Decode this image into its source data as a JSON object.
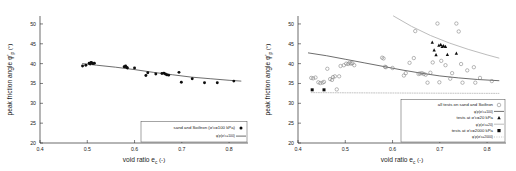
{
  "figure": {
    "panels": [
      "left",
      "right"
    ],
    "colors": {
      "marker_filled": "#0d0d0d",
      "marker_open_stroke": "#7d7d7d",
      "curve_100": "#3c3c3c",
      "curve_20": "#b8b8b8",
      "curve_2000": "#9a9a9a",
      "axis": "#2b2b2b"
    }
  },
  "chart_data": [
    {
      "id": "left",
      "type": "scatter",
      "title": "",
      "xlabel": "void ratio e",
      "xlabel_sub": "c",
      "xlabel_unit": "(-)",
      "ylabel": "peak friction angle φ'",
      "ylabel_sub": "p",
      "ylabel_unit": "(°)",
      "xlim": [
        0.4,
        0.84
      ],
      "ylim": [
        20,
        52
      ],
      "xticks": [
        0.4,
        0.5,
        0.6,
        0.7,
        0.8
      ],
      "xticklabels": [
        "0.4",
        "0.5",
        "0.6",
        "0.7",
        "0.8"
      ],
      "yticks": [
        20,
        25,
        30,
        35,
        40,
        45,
        50
      ],
      "yticklabels": [
        "20",
        "25",
        "30",
        "35",
        "40",
        "45",
        "50"
      ],
      "grid": false,
      "legend_position": "lower right",
      "series": [
        {
          "name": "sand and Soiltron (σ'c=100 kPa)",
          "marker": "filled-circle",
          "points": [
            [
              0.49,
              39.4
            ],
            [
              0.497,
              39.6
            ],
            [
              0.504,
              40.1
            ],
            [
              0.506,
              39.9
            ],
            [
              0.508,
              40.3
            ],
            [
              0.51,
              40.2
            ],
            [
              0.512,
              40.0
            ],
            [
              0.515,
              40.1
            ],
            [
              0.578,
              39.2
            ],
            [
              0.581,
              39.4
            ],
            [
              0.583,
              39.1
            ],
            [
              0.585,
              38.9
            ],
            [
              0.6,
              38.9
            ],
            [
              0.624,
              37.0
            ],
            [
              0.628,
              37.7
            ],
            [
              0.645,
              37.4
            ],
            [
              0.658,
              37.5
            ],
            [
              0.662,
              37.6
            ],
            [
              0.665,
              37.4
            ],
            [
              0.668,
              37.2
            ],
            [
              0.672,
              37.1
            ],
            [
              0.694,
              37.8
            ],
            [
              0.699,
              35.3
            ],
            [
              0.722,
              36.2
            ],
            [
              0.748,
              35.2
            ],
            [
              0.775,
              35.2
            ],
            [
              0.81,
              35.6
            ]
          ]
        }
      ],
      "curves": [
        {
          "name": "φ'p(σ'c=100)",
          "style": "solid",
          "color": "#3c3c3c",
          "x": [
            0.49,
            0.52,
            0.56,
            0.6,
            0.64,
            0.68,
            0.72,
            0.76,
            0.8,
            0.825
          ],
          "y": [
            40.0,
            39.6,
            39.1,
            38.5,
            37.8,
            37.2,
            36.6,
            36.2,
            35.8,
            35.6
          ]
        }
      ],
      "legend": [
        {
          "label": "sand and Soiltron (σ'",
          "sub": "c",
          "tail": "=100 kPa)",
          "symbol": "filled-circle"
        },
        {
          "label": "φ'",
          "sub": "p",
          "tail": "(σ'c=100)",
          "symbol": "line-solid-dark"
        }
      ]
    },
    {
      "id": "right",
      "type": "scatter",
      "title": "",
      "xlabel": "void ratio e",
      "xlabel_sub": "c",
      "xlabel_unit": "(-)",
      "ylabel": "peak friction angle φ'",
      "ylabel_sub": "p",
      "ylabel_unit": "(°)",
      "xlim": [
        0.4,
        0.84
      ],
      "ylim": [
        20,
        52
      ],
      "xticks": [
        0.4,
        0.5,
        0.6,
        0.7,
        0.8
      ],
      "xticklabels": [
        "0.4",
        "0.5",
        "0.6",
        "0.7",
        "0.8"
      ],
      "yticks": [
        20,
        25,
        30,
        35,
        40,
        45,
        50
      ],
      "yticklabels": [
        "20",
        "25",
        "30",
        "35",
        "40",
        "45",
        "50"
      ],
      "grid": false,
      "legend_position": "lower right",
      "series": [
        {
          "name": "all tests on sand and Soiltron",
          "marker": "open-circle",
          "points": [
            [
              0.428,
              36.4
            ],
            [
              0.432,
              36.3
            ],
            [
              0.437,
              36.5
            ],
            [
              0.443,
              35.3
            ],
            [
              0.447,
              35.1
            ],
            [
              0.452,
              35.2
            ],
            [
              0.455,
              35.4
            ],
            [
              0.462,
              38.7
            ],
            [
              0.468,
              36.1
            ],
            [
              0.472,
              35.9
            ],
            [
              0.474,
              36.6
            ],
            [
              0.478,
              36.8
            ],
            [
              0.482,
              33.5
            ],
            [
              0.487,
              36.8
            ],
            [
              0.49,
              39.4
            ],
            [
              0.497,
              39.6
            ],
            [
              0.502,
              40.0
            ],
            [
              0.506,
              39.9
            ],
            [
              0.509,
              40.2
            ],
            [
              0.512,
              40.0
            ],
            [
              0.515,
              40.1
            ],
            [
              0.519,
              39.6
            ],
            [
              0.578,
              41.5
            ],
            [
              0.581,
              41.3
            ],
            [
              0.584,
              39.2
            ],
            [
              0.586,
              39.1
            ],
            [
              0.6,
              38.9
            ],
            [
              0.624,
              37.0
            ],
            [
              0.628,
              37.6
            ],
            [
              0.636,
              40.2
            ],
            [
              0.645,
              41.4
            ],
            [
              0.648,
              48.2
            ],
            [
              0.655,
              37.4
            ],
            [
              0.658,
              37.5
            ],
            [
              0.662,
              37.6
            ],
            [
              0.666,
              37.4
            ],
            [
              0.67,
              37.2
            ],
            [
              0.674,
              35.2
            ],
            [
              0.68,
              37.7
            ],
            [
              0.685,
              40.3
            ],
            [
              0.695,
              50.1
            ],
            [
              0.699,
              35.3
            ],
            [
              0.703,
              40.7
            ],
            [
              0.712,
              39.6
            ],
            [
              0.722,
              36.2
            ],
            [
              0.726,
              37.6
            ],
            [
              0.735,
              50.1
            ],
            [
              0.74,
              48.1
            ],
            [
              0.745,
              39.9
            ],
            [
              0.748,
              35.2
            ],
            [
              0.758,
              38.3
            ],
            [
              0.772,
              39.1
            ],
            [
              0.775,
              35.2
            ],
            [
              0.785,
              36.4
            ],
            [
              0.81,
              35.6
            ]
          ]
        },
        {
          "name": "tests at σ'c=20 kPa",
          "marker": "filled-triangle",
          "points": [
            [
              0.684,
              45.4
            ],
            [
              0.688,
              43.4
            ],
            [
              0.692,
              42.2
            ],
            [
              0.698,
              44.6
            ],
            [
              0.702,
              44.8
            ],
            [
              0.705,
              44.3
            ],
            [
              0.708,
              44.5
            ],
            [
              0.712,
              44.3
            ],
            [
              0.716,
              42.3
            ],
            [
              0.735,
              42.6
            ]
          ]
        },
        {
          "name": "tests at σ'c=2000 kPa",
          "marker": "filled-square",
          "points": [
            [
              0.43,
              33.4
            ],
            [
              0.455,
              33.4
            ]
          ]
        }
      ],
      "curves": [
        {
          "name": "φ'p(σ'c=100)",
          "style": "solid",
          "color": "#3c3c3c",
          "x": [
            0.422,
            0.46,
            0.5,
            0.54,
            0.58,
            0.62,
            0.66,
            0.7,
            0.74,
            0.78,
            0.825
          ],
          "y": [
            42.7,
            42.0,
            41.1,
            40.2,
            39.3,
            38.4,
            37.6,
            36.9,
            36.4,
            36.0,
            35.7
          ]
        },
        {
          "name": "φ'p(σ'c=20)",
          "style": "solid-light",
          "color": "#b8b8b8",
          "x": [
            0.602,
            0.64,
            0.68,
            0.72,
            0.76,
            0.8,
            0.825
          ],
          "y": [
            52.0,
            49.4,
            47.1,
            45.2,
            43.6,
            42.2,
            41.4
          ]
        },
        {
          "name": "φ'p(σ'c=2000)",
          "style": "dotted",
          "color": "#9a9a9a",
          "x": [
            0.428,
            0.5,
            0.6,
            0.7,
            0.825
          ],
          "y": [
            32.7,
            32.65,
            32.6,
            32.55,
            32.5
          ]
        }
      ],
      "legend": [
        {
          "label": "all tests on sand and Soiltron",
          "symbol": "open-circle"
        },
        {
          "label": "φ'p(σ'c=100)",
          "symbol": "line-solid-dark"
        },
        {
          "label": "tests at σ'c=20 kPa",
          "symbol": "filled-triangle"
        },
        {
          "label": "φ'p(σ'c=20)",
          "symbol": "line-solid-light"
        },
        {
          "label": "tests at σ'c=2000 kPa",
          "symbol": "filled-square"
        },
        {
          "label": "φ'p(σ'c=2000)",
          "symbol": "line-dotted"
        }
      ]
    }
  ]
}
